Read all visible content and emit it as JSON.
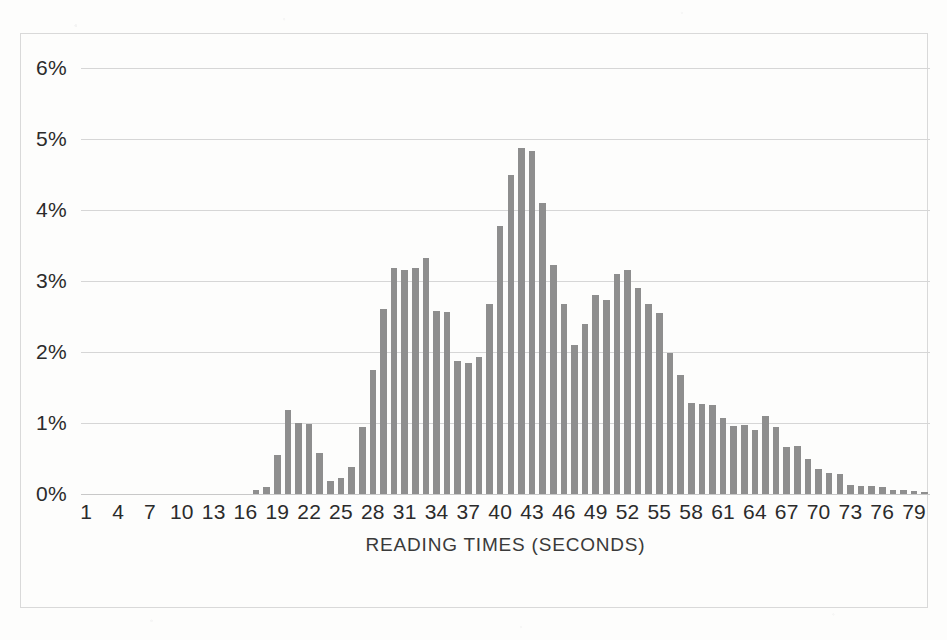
{
  "chart_data": {
    "type": "bar",
    "title": "",
    "xlabel": "READING TIMES (SECONDS)",
    "ylabel": "",
    "grid": true,
    "legend": false,
    "xlim": [
      1,
      80
    ],
    "ylim": [
      0,
      6
    ],
    "y_tick_labels": [
      "0%",
      "1%",
      "2%",
      "3%",
      "4%",
      "5%",
      "6%"
    ],
    "y_tick_values": [
      0,
      1,
      2,
      3,
      4,
      5,
      6
    ],
    "x_tick_labels": [
      "1",
      "4",
      "7",
      "10",
      "13",
      "16",
      "19",
      "22",
      "25",
      "28",
      "31",
      "34",
      "37",
      "40",
      "43",
      "46",
      "49",
      "52",
      "55",
      "58",
      "61",
      "64",
      "67",
      "70",
      "73",
      "76",
      "79"
    ],
    "x_tick_values": [
      1,
      4,
      7,
      10,
      13,
      16,
      19,
      22,
      25,
      28,
      31,
      34,
      37,
      40,
      43,
      46,
      49,
      52,
      55,
      58,
      61,
      64,
      67,
      70,
      73,
      76,
      79
    ],
    "value_unit": "percent",
    "bar_color": "#8e8e8e",
    "gridline_color": "#d6d6d6",
    "categories": [
      1,
      2,
      3,
      4,
      5,
      6,
      7,
      8,
      9,
      10,
      11,
      12,
      13,
      14,
      15,
      16,
      17,
      18,
      19,
      20,
      21,
      22,
      23,
      24,
      25,
      26,
      27,
      28,
      29,
      30,
      31,
      32,
      33,
      34,
      35,
      36,
      37,
      38,
      39,
      40,
      41,
      42,
      43,
      44,
      45,
      46,
      47,
      48,
      49,
      50,
      51,
      52,
      53,
      54,
      55,
      56,
      57,
      58,
      59,
      60,
      61,
      62,
      63,
      64,
      65,
      66,
      67,
      68,
      69,
      70,
      71,
      72,
      73,
      74,
      75,
      76,
      77,
      78,
      79,
      80
    ],
    "values": [
      0,
      0,
      0,
      0,
      0,
      0,
      0,
      0,
      0,
      0,
      0,
      0,
      0,
      0,
      0,
      0,
      0.05,
      0.1,
      0.55,
      1.18,
      1.0,
      0.98,
      0.58,
      0.18,
      0.22,
      0.38,
      0.95,
      1.75,
      2.6,
      3.18,
      3.15,
      3.18,
      3.33,
      2.58,
      2.57,
      1.87,
      1.85,
      1.93,
      2.67,
      3.78,
      4.5,
      4.88,
      4.83,
      4.1,
      3.22,
      2.67,
      2.1,
      2.4,
      2.8,
      2.73,
      3.1,
      3.15,
      2.9,
      2.67,
      2.55,
      1.98,
      1.67,
      1.28,
      1.27,
      1.25,
      1.07,
      0.96,
      0.97,
      0.9,
      1.1,
      0.95,
      0.66,
      0.68,
      0.5,
      0.35,
      0.3,
      0.28,
      0.13,
      0.11,
      0.11,
      0.1,
      0.05,
      0.05,
      0.04,
      0.03
    ]
  },
  "ghost_marks": [
    {
      "text": "",
      "left": 55,
      "top": 6
    },
    {
      "text": "",
      "left": 150,
      "top": 8
    },
    {
      "text": "",
      "left": 60,
      "top": 78
    },
    {
      "text": "",
      "left": 70,
      "top": 150
    },
    {
      "text": "",
      "left": 820,
      "top": 620
    }
  ]
}
